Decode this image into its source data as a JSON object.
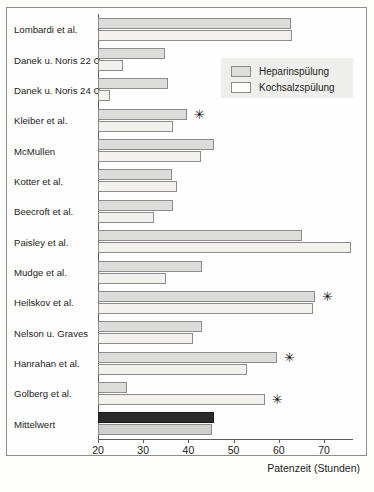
{
  "figure": {
    "axis_title": "Patenzeit (Stunden)",
    "significance_marker": "✳"
  },
  "legend": {
    "position": "top-right",
    "entries": [
      {
        "label": "Heparinspülung",
        "color": "#dcdcda"
      },
      {
        "label": "Kochsalzspülung",
        "color": "#fbfbf9"
      }
    ]
  },
  "chart_data": {
    "type": "bar",
    "orientation": "horizontal",
    "title": "",
    "xlabel": "Patenzeit (Stunden)",
    "ylabel": "",
    "xlim": [
      20,
      76
    ],
    "xticks": [
      20,
      30,
      40,
      50,
      60,
      70
    ],
    "xticklabels": [
      "20",
      "30",
      "40",
      "50",
      "60",
      "70"
    ],
    "grid": false,
    "legend_position": "top-right",
    "categories": [
      "Lombardi et al.",
      "Danek u. Noris 22 G",
      "Danek u. Noris 24 G",
      "Kleiber et al.",
      "McMullen",
      "Kotter  et al.",
      "Beecroft et al.",
      "Paisley et al.",
      "Mudge et al.",
      "Heilskov  et al.",
      "Nelson u. Graves",
      "Hanrahan et al.",
      "Golberg et al.",
      "Mittelwert"
    ],
    "series": [
      {
        "name": "Heparinspülung",
        "values": [
          62.7,
          34.9,
          35.4,
          39.7,
          45.6,
          36.4,
          36.6,
          65.1,
          43.0,
          68.0,
          43.0,
          59.6,
          26.4,
          45.7
        ]
      },
      {
        "name": "Kochsalzspülung",
        "values": [
          62.9,
          25.5,
          22.6,
          36.6,
          42.7,
          37.5,
          32.3,
          76.0,
          35.0,
          67.6,
          41.0,
          53.0,
          56.9,
          45.2
        ]
      }
    ],
    "significance_markers": [
      {
        "category": "Kleiber et al.",
        "value": 39.7
      },
      {
        "category": "Heilskov  et al.",
        "value": 68.0
      },
      {
        "category": "Hanrahan et al.",
        "value": 59.6
      },
      {
        "category": "Golberg et al.",
        "value": 56.9
      }
    ]
  }
}
